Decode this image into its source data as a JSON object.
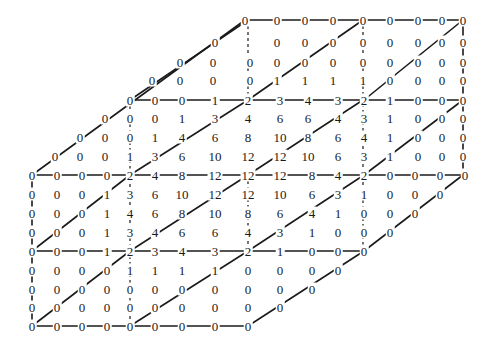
{
  "diagram": {
    "title": "",
    "rows": [
      {
        "y": 20,
        "cells": [
          [
            245,
            0
          ],
          [
            277,
            0
          ],
          [
            305,
            0
          ],
          [
            333,
            0
          ],
          [
            363,
            0
          ],
          [
            390,
            0
          ],
          [
            418,
            0
          ],
          [
            442,
            0
          ],
          [
            463,
            0
          ]
        ]
      },
      {
        "y": 42,
        "cells": [
          [
            215,
            0
          ],
          [
            277,
            0
          ],
          [
            305,
            0
          ],
          [
            333,
            0
          ],
          [
            363,
            0
          ],
          [
            390,
            0
          ],
          [
            418,
            0
          ],
          [
            442,
            0
          ],
          [
            463,
            0
          ]
        ]
      },
      {
        "y": 62,
        "cells": [
          [
            180,
            0
          ],
          [
            213,
            0
          ],
          [
            250,
            0
          ],
          [
            277,
            0
          ],
          [
            305,
            0
          ],
          [
            333,
            0
          ],
          [
            363,
            0
          ],
          [
            390,
            0
          ],
          [
            418,
            0
          ],
          [
            442,
            0
          ],
          [
            463,
            0
          ]
        ]
      },
      {
        "y": 80,
        "cells": [
          [
            152,
            0
          ],
          [
            180,
            0
          ],
          [
            213,
            0
          ],
          [
            250,
            0
          ],
          [
            277,
            1
          ],
          [
            305,
            1
          ],
          [
            333,
            1
          ],
          [
            363,
            1
          ],
          [
            390,
            0
          ],
          [
            418,
            0
          ],
          [
            442,
            0
          ],
          [
            463,
            0
          ]
        ]
      },
      {
        "y": 100,
        "cells": [
          [
            130,
            0
          ],
          [
            155,
            0
          ],
          [
            182,
            0
          ],
          [
            215,
            1
          ],
          [
            248,
            2
          ],
          [
            280,
            3
          ],
          [
            308,
            4
          ],
          [
            338,
            3
          ],
          [
            364,
            2
          ],
          [
            390,
            1
          ],
          [
            418,
            0
          ],
          [
            442,
            0
          ],
          [
            463,
            0
          ]
        ]
      },
      {
        "y": 118,
        "cells": [
          [
            105,
            0
          ],
          [
            130,
            0
          ],
          [
            155,
            0
          ],
          [
            182,
            1
          ],
          [
            215,
            3
          ],
          [
            248,
            4
          ],
          [
            280,
            6
          ],
          [
            308,
            6
          ],
          [
            338,
            4
          ],
          [
            364,
            3
          ],
          [
            390,
            1
          ],
          [
            418,
            0
          ],
          [
            442,
            0
          ],
          [
            463,
            0
          ]
        ]
      },
      {
        "y": 137,
        "cells": [
          [
            80,
            0
          ],
          [
            105,
            0
          ],
          [
            130,
            0
          ],
          [
            155,
            1
          ],
          [
            182,
            4
          ],
          [
            215,
            6
          ],
          [
            248,
            8
          ],
          [
            280,
            10
          ],
          [
            308,
            8
          ],
          [
            338,
            6
          ],
          [
            364,
            4
          ],
          [
            390,
            1
          ],
          [
            418,
            0
          ],
          [
            442,
            0
          ],
          [
            463,
            0
          ]
        ]
      },
      {
        "y": 156,
        "cells": [
          [
            55,
            0
          ],
          [
            80,
            0
          ],
          [
            105,
            0
          ],
          [
            130,
            1
          ],
          [
            155,
            3
          ],
          [
            182,
            6
          ],
          [
            215,
            10
          ],
          [
            248,
            12
          ],
          [
            280,
            12
          ],
          [
            308,
            10
          ],
          [
            338,
            6
          ],
          [
            364,
            3
          ],
          [
            390,
            1
          ],
          [
            418,
            0
          ],
          [
            442,
            0
          ],
          [
            463,
            0
          ]
        ]
      },
      {
        "y": 175,
        "cells": [
          [
            32,
            0
          ],
          [
            57,
            0
          ],
          [
            82,
            0
          ],
          [
            107,
            0
          ],
          [
            130,
            2
          ],
          [
            155,
            4
          ],
          [
            182,
            8
          ],
          [
            215,
            12
          ],
          [
            248,
            12
          ],
          [
            280,
            12
          ],
          [
            312,
            8
          ],
          [
            338,
            4
          ],
          [
            364,
            2
          ],
          [
            390,
            0
          ],
          [
            415,
            0
          ],
          [
            440,
            0
          ],
          [
            465,
            0
          ]
        ]
      },
      {
        "y": 194,
        "cells": [
          [
            32,
            0
          ],
          [
            57,
            0
          ],
          [
            82,
            0
          ],
          [
            107,
            1
          ],
          [
            130,
            3
          ],
          [
            155,
            6
          ],
          [
            182,
            10
          ],
          [
            215,
            12
          ],
          [
            248,
            12
          ],
          [
            280,
            10
          ],
          [
            312,
            6
          ],
          [
            338,
            3
          ],
          [
            364,
            1
          ],
          [
            390,
            0
          ],
          [
            415,
            0
          ],
          [
            440,
            0
          ]
        ]
      },
      {
        "y": 213,
        "cells": [
          [
            32,
            0
          ],
          [
            57,
            0
          ],
          [
            82,
            0
          ],
          [
            107,
            1
          ],
          [
            130,
            4
          ],
          [
            155,
            6
          ],
          [
            182,
            8
          ],
          [
            215,
            10
          ],
          [
            248,
            8
          ],
          [
            280,
            6
          ],
          [
            312,
            4
          ],
          [
            338,
            1
          ],
          [
            364,
            0
          ],
          [
            390,
            0
          ],
          [
            415,
            0
          ]
        ]
      },
      {
        "y": 232,
        "cells": [
          [
            32,
            0
          ],
          [
            57,
            0
          ],
          [
            82,
            0
          ],
          [
            107,
            1
          ],
          [
            130,
            3
          ],
          [
            155,
            4
          ],
          [
            182,
            6
          ],
          [
            215,
            6
          ],
          [
            248,
            4
          ],
          [
            280,
            3
          ],
          [
            312,
            1
          ],
          [
            338,
            0
          ],
          [
            364,
            0
          ],
          [
            390,
            0
          ]
        ]
      },
      {
        "y": 251,
        "cells": [
          [
            32,
            0
          ],
          [
            57,
            0
          ],
          [
            82,
            0
          ],
          [
            107,
            1
          ],
          [
            130,
            2
          ],
          [
            155,
            3
          ],
          [
            182,
            4
          ],
          [
            215,
            3
          ],
          [
            248,
            2
          ],
          [
            280,
            1
          ],
          [
            312,
            0
          ],
          [
            338,
            0
          ],
          [
            364,
            0
          ]
        ]
      },
      {
        "y": 270,
        "cells": [
          [
            32,
            0
          ],
          [
            57,
            0
          ],
          [
            82,
            0
          ],
          [
            107,
            0
          ],
          [
            130,
            1
          ],
          [
            155,
            1
          ],
          [
            182,
            1
          ],
          [
            215,
            1
          ],
          [
            248,
            0
          ],
          [
            280,
            0
          ],
          [
            312,
            0
          ],
          [
            338,
            0
          ]
        ]
      },
      {
        "y": 289,
        "cells": [
          [
            32,
            0
          ],
          [
            57,
            0
          ],
          [
            82,
            0
          ],
          [
            107,
            0
          ],
          [
            130,
            0
          ],
          [
            155,
            0
          ],
          [
            182,
            0
          ],
          [
            215,
            0
          ],
          [
            248,
            0
          ],
          [
            280,
            0
          ],
          [
            312,
            0
          ]
        ]
      },
      {
        "y": 307,
        "cells": [
          [
            32,
            0
          ],
          [
            57,
            0
          ],
          [
            82,
            0
          ],
          [
            107,
            0
          ],
          [
            130,
            0
          ],
          [
            155,
            0
          ],
          [
            182,
            0
          ],
          [
            215,
            0
          ],
          [
            248,
            0
          ],
          [
            280,
            0
          ]
        ]
      },
      {
        "y": 326,
        "cells": [
          [
            32,
            0
          ],
          [
            57,
            0
          ],
          [
            82,
            0
          ],
          [
            107,
            0
          ],
          [
            130,
            0
          ],
          [
            155,
            0
          ],
          [
            182,
            0
          ],
          [
            215,
            0
          ],
          [
            248,
            0
          ]
        ]
      }
    ],
    "lines": {
      "color": "#1a1a1a",
      "horizontal": [
        [
          245,
          20,
          463,
          20
        ],
        [
          130,
          100,
          463,
          100
        ],
        [
          32,
          175,
          465,
          175
        ],
        [
          32,
          251,
          364,
          251
        ],
        [
          32,
          326,
          248,
          326
        ]
      ],
      "vertical_solid": [
        [
          32,
          175,
          32,
          326
        ],
        [
          463,
          20,
          463,
          175
        ]
      ],
      "vertical_dashed": [
        [
          130,
          100,
          130,
          326
        ],
        [
          248,
          20,
          248,
          100
        ],
        [
          248,
          175,
          248,
          251
        ],
        [
          363,
          20,
          363,
          251
        ]
      ],
      "diagonal": [
        [
          32,
          175,
          245,
          20
        ],
        [
          130,
          175,
          248,
          100
        ],
        [
          248,
          175,
          363,
          100
        ],
        [
          364,
          175,
          463,
          100
        ],
        [
          130,
          100,
          248,
          20
        ],
        [
          248,
          100,
          363,
          20
        ],
        [
          364,
          100,
          463,
          20
        ],
        [
          32,
          251,
          130,
          175
        ],
        [
          130,
          251,
          248,
          175
        ],
        [
          248,
          251,
          364,
          175
        ],
        [
          364,
          251,
          463,
          175
        ],
        [
          32,
          326,
          130,
          251
        ],
        [
          130,
          326,
          248,
          251
        ],
        [
          248,
          326,
          364,
          251
        ]
      ]
    }
  }
}
